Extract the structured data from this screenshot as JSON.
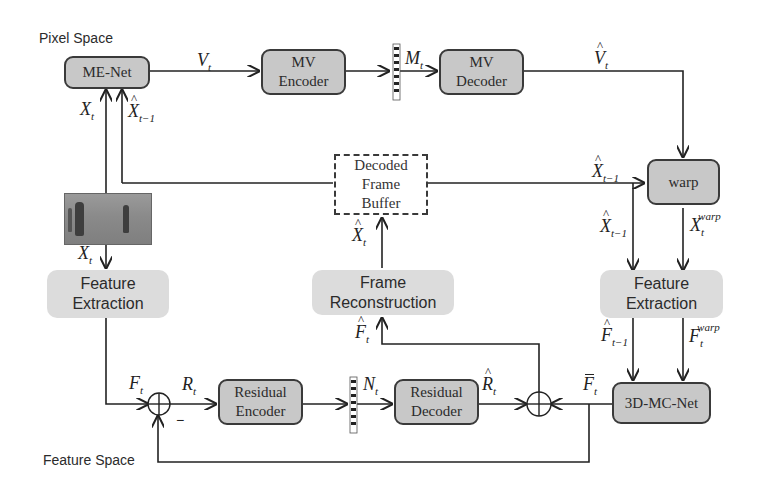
{
  "labels": {
    "pixel_space": "Pixel Space",
    "feature_space": "Feature Space"
  },
  "blocks": {
    "me_net": "ME-Net",
    "mv_encoder": "MV Encoder",
    "mv_encoder_l1": "MV",
    "mv_encoder_l2": "Encoder",
    "mv_decoder_l1": "MV",
    "mv_decoder_l2": "Decoder",
    "warp": "warp",
    "dfb_l1": "Decoded",
    "dfb_l2": "Frame",
    "dfb_l3": "Buffer",
    "fe_left_l1": "Feature",
    "fe_left_l2": "Extraction",
    "fe_right_l1": "Feature",
    "fe_right_l2": "Extraction",
    "frame_recon_l1": "Frame",
    "frame_recon_l2": "Reconstruction",
    "res_enc_l1": "Residual",
    "res_enc_l2": "Encoder",
    "res_dec_l1": "Residual",
    "res_dec_l2": "Decoder",
    "mc_net": "3D-MC-Net"
  },
  "symbols": {
    "V": "V",
    "M": "M",
    "X": "X",
    "F": "F",
    "R": "R",
    "N": "N",
    "t": "t",
    "t_minus_1": "t−1",
    "warp": "warp",
    "minus": "−"
  },
  "input_image": "video-frame-two-people-on-field"
}
